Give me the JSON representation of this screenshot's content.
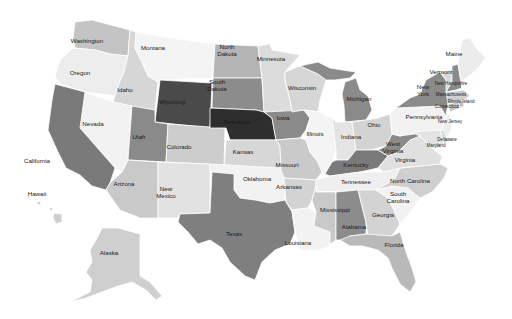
{
  "map": {
    "type": "choropleth",
    "region": "United States",
    "color_scale": "grayscale",
    "background": "#ffffff",
    "states": [
      {
        "id": "WA",
        "name": "Washington",
        "fill": "#c4c4c4",
        "lx": 87,
        "ly": 43
      },
      {
        "id": "OR",
        "name": "Oregon",
        "fill": "#ededed",
        "lx": 80,
        "ly": 75
      },
      {
        "id": "CA",
        "name": "California",
        "fill": "#7a7a7a",
        "lx": 37,
        "ly": 163
      },
      {
        "id": "ID",
        "name": "Idaho",
        "fill": "#d6d6d6",
        "lx": 125,
        "ly": 92
      },
      {
        "id": "NV",
        "name": "Nevada",
        "fill": "#f2f2f2",
        "lx": 93,
        "ly": 126
      },
      {
        "id": "MT",
        "name": "Montana",
        "fill": "#f4f4f4",
        "lx": 153,
        "ly": 50
      },
      {
        "id": "WY",
        "name": "Wyoming",
        "fill": "#4a4a4a",
        "lx": 172,
        "ly": 104
      },
      {
        "id": "UT",
        "name": "Utah",
        "fill": "#8a8a8a",
        "lx": 139,
        "ly": 139
      },
      {
        "id": "CO",
        "name": "Colorado",
        "fill": "#cdcdcd",
        "lx": 179,
        "ly": 149
      },
      {
        "id": "AZ",
        "name": "Arizona",
        "fill": "#c9c9c9",
        "lx": 124,
        "ly": 186
      },
      {
        "id": "NM",
        "name": "New Mexico",
        "fill": "#e2e2e2",
        "lx": 166,
        "ly": 194
      },
      {
        "id": "ND",
        "name": "North Dakota",
        "fill": "#b4b4b4",
        "lx": 227,
        "ly": 52
      },
      {
        "id": "SD",
        "name": "South Dakota",
        "fill": "#8c8c8c",
        "lx": 217,
        "ly": 87
      },
      {
        "id": "NE",
        "name": "Nebraska",
        "fill": "#2e2e2e",
        "lx": 237,
        "ly": 124
      },
      {
        "id": "KS",
        "name": "Kansas",
        "fill": "#d7d7d7",
        "lx": 243,
        "ly": 154
      },
      {
        "id": "OK",
        "name": "Oklahoma",
        "fill": "#f2f2f2",
        "lx": 257,
        "ly": 181
      },
      {
        "id": "TX",
        "name": "Texas",
        "fill": "#7f7f7f",
        "lx": 234,
        "ly": 236
      },
      {
        "id": "MN",
        "name": "Minnesota",
        "fill": "#dcdcdc",
        "lx": 271,
        "ly": 61
      },
      {
        "id": "IA",
        "name": "Iowa",
        "fill": "#8a8a8a",
        "lx": 283,
        "ly": 120
      },
      {
        "id": "MO",
        "name": "Missouri",
        "fill": "#cacaca",
        "lx": 287,
        "ly": 167
      },
      {
        "id": "AR",
        "name": "Arkansas",
        "fill": "#d3d3d3",
        "lx": 289,
        "ly": 189
      },
      {
        "id": "LA",
        "name": "Louisiana",
        "fill": "#f2f2f2",
        "lx": 298,
        "ly": 245
      },
      {
        "id": "WI",
        "name": "Wisconsin",
        "fill": "#d6d6d6",
        "lx": 302,
        "ly": 90
      },
      {
        "id": "IL",
        "name": "Illinois",
        "fill": "#f4f4f4",
        "lx": 315,
        "ly": 136
      },
      {
        "id": "MI",
        "name": "Michigan",
        "fill": "#8a8a8a",
        "lx": 359,
        "ly": 101
      },
      {
        "id": "IN",
        "name": "Indiana",
        "fill": "#e4e4e4",
        "lx": 351,
        "ly": 139
      },
      {
        "id": "OH",
        "name": "Ohio",
        "fill": "#d3d3d3",
        "lx": 374,
        "ly": 127
      },
      {
        "id": "KY",
        "name": "Kentucky",
        "fill": "#7a7a7a",
        "lx": 356,
        "ly": 167
      },
      {
        "id": "TN",
        "name": "Tennessee",
        "fill": "#efefef",
        "lx": 356,
        "ly": 184
      },
      {
        "id": "MS",
        "name": "Mississippi",
        "fill": "#c9c9c9",
        "lx": 335,
        "ly": 212
      },
      {
        "id": "AL",
        "name": "Alabama",
        "fill": "#8c8c8c",
        "lx": 354,
        "ly": 229
      },
      {
        "id": "GA",
        "name": "Georgia",
        "fill": "#d3d3d3",
        "lx": 383,
        "ly": 217
      },
      {
        "id": "FL",
        "name": "Florida",
        "fill": "#b9b9b9",
        "lx": 394,
        "ly": 247
      },
      {
        "id": "SC",
        "name": "South Carolina",
        "fill": "#f2f2f2",
        "lx": 398,
        "ly": 199
      },
      {
        "id": "NC",
        "name": "North Carolina",
        "fill": "#cfcfcf",
        "lx": 410,
        "ly": 183
      },
      {
        "id": "VA",
        "name": "Virginia",
        "fill": "#e0e0e0",
        "lx": 405,
        "ly": 162
      },
      {
        "id": "WV",
        "name": "West Virginia",
        "fill": "#8a8a8a",
        "lx": 393,
        "ly": 149
      },
      {
        "id": "PA",
        "name": "Pennsylvania",
        "fill": "#f2f2f2",
        "lx": 424,
        "ly": 119
      },
      {
        "id": "NY",
        "name": "New York",
        "fill": "#8a8a8a",
        "lx": 423,
        "ly": 92
      },
      {
        "id": "NJ",
        "name": "New Jersey",
        "fill": "#ededed",
        "lx": 450,
        "ly": 123
      },
      {
        "id": "DE",
        "name": "Delaware",
        "fill": "#dcdcdc",
        "lx": 447,
        "ly": 141
      },
      {
        "id": "MD",
        "name": "Maryland",
        "fill": "#e4e4e4",
        "lx": 436,
        "ly": 147
      },
      {
        "id": "CT",
        "name": "Connecticut",
        "fill": "#c4c4c4",
        "lx": 447,
        "ly": 108
      },
      {
        "id": "RI",
        "name": "Rhode Island",
        "fill": "#bdbdbd",
        "lx": 461,
        "ly": 103
      },
      {
        "id": "MA",
        "name": "Massachusetts",
        "fill": "#cfcfcf",
        "lx": 451,
        "ly": 96
      },
      {
        "id": "NH",
        "name": "New Hampshire",
        "fill": "#8a8a8a",
        "lx": 451,
        "ly": 85
      },
      {
        "id": "VT",
        "name": "Vermont",
        "fill": "#dadada",
        "lx": 441,
        "ly": 74
      },
      {
        "id": "ME",
        "name": "Maine",
        "fill": "#ececec",
        "lx": 454,
        "ly": 56
      },
      {
        "id": "AK",
        "name": "Alaska",
        "fill": "#cfcfcf",
        "lx": 109,
        "ly": 255
      },
      {
        "id": "HI",
        "name": "Hawaii",
        "fill": "#cfcfcf",
        "lx": 37,
        "ly": 196
      }
    ]
  }
}
